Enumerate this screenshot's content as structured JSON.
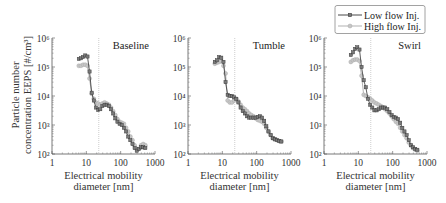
{
  "legend": {
    "items": [
      {
        "label": "Low flow Inj.",
        "color": "#333333",
        "marker": "square"
      },
      {
        "label": "High flow Inj.",
        "color": "#a8a8a8",
        "marker": "circle"
      }
    ]
  },
  "chart_data": [
    {
      "type": "line",
      "title": "Baseline",
      "xlabel": "Electrical mobility diameter [nm]",
      "xlabel_lines": [
        "Electrical mobility",
        "diameter [nm]"
      ],
      "ylabel": "Particle number concentration EEPS [#/cm³]",
      "ylabel_lines": [
        "Particle number",
        "concentration EEPS [#/cm³]"
      ],
      "xscale": "log",
      "yscale": "log",
      "xlim": [
        1,
        1000
      ],
      "ylim": [
        100,
        1000000
      ],
      "xticks": [
        1,
        10,
        100,
        1000
      ],
      "xticklabels": [
        "1",
        "10",
        "100",
        "1000"
      ],
      "yticks": [
        100,
        1000,
        10000,
        100000,
        1000000
      ],
      "yticklabels": [
        "10²",
        "10³",
        "10⁴",
        "10⁵",
        "10⁶"
      ],
      "vline_x": 23,
      "grid": false,
      "x": [
        6.04,
        6.98,
        8.06,
        9.31,
        10.8,
        12.4,
        14.3,
        16.5,
        19.1,
        22.1,
        25.5,
        29.4,
        34.0,
        39.2,
        45.3,
        52.3,
        60.4,
        69.8,
        80.6,
        93.1,
        107.5,
        124.1,
        143.3,
        165.5,
        191.1,
        220.7,
        254.8,
        294.3,
        339.8,
        392.4,
        453.2,
        523.3
      ],
      "series": [
        {
          "name": "Low flow Inj.",
          "values": [
            190000,
            200000,
            220000,
            250000,
            230000,
            70000,
            13000,
            7000,
            4000,
            3300,
            3500,
            4500,
            5000,
            5000,
            4500,
            3500,
            2500,
            1700,
            1300,
            1100,
            1000,
            800,
            600,
            400,
            300,
            220,
            160,
            130,
            150,
            170,
            170,
            160
          ]
        },
        {
          "name": "High flow Inj.",
          "values": [
            110000,
            110000,
            120000,
            120000,
            110000,
            40000,
            12000,
            8000,
            6000,
            5500,
            5000,
            5500,
            6000,
            5500,
            5000,
            4000,
            3000,
            2200,
            1600,
            1300,
            1200,
            1100,
            800,
            600,
            400,
            300,
            200,
            150,
            150,
            200,
            220,
            200
          ]
        }
      ]
    },
    {
      "type": "line",
      "title": "Tumble",
      "xlabel": "Electrical mobility diameter [nm]",
      "xlabel_lines": [
        "Electrical mobility",
        "diameter [nm]"
      ],
      "ylabel": "",
      "ylabel_lines": [],
      "xscale": "log",
      "yscale": "log",
      "xlim": [
        1,
        1000
      ],
      "ylim": [
        100,
        1000000
      ],
      "xticks": [
        1,
        10,
        100,
        1000
      ],
      "xticklabels": [
        "1",
        "10",
        "100",
        "1000"
      ],
      "yticks": [
        100,
        1000,
        10000,
        100000,
        1000000
      ],
      "yticklabels": [
        "10²",
        "10³",
        "10⁴",
        "10⁵",
        "10⁶"
      ],
      "vline_x": 23,
      "grid": false,
      "x": [
        6.04,
        6.98,
        8.06,
        9.31,
        10.8,
        12.4,
        14.3,
        16.5,
        19.1,
        22.1,
        25.5,
        29.4,
        34.0,
        39.2,
        45.3,
        52.3,
        60.4,
        69.8,
        80.6,
        93.1,
        107.5,
        124.1,
        143.3,
        165.5,
        191.1,
        220.7,
        254.8,
        294.3,
        339.8,
        392.4,
        453.2,
        523.3
      ],
      "series": [
        {
          "name": "Low flow Inj.",
          "values": [
            150000,
            170000,
            220000,
            210000,
            150000,
            30000,
            11000,
            10000,
            10000,
            9000,
            8000,
            6000,
            4000,
            3000,
            2500,
            2000,
            1800,
            1800,
            1800,
            1800,
            1900,
            2000,
            1800,
            1400,
            900,
            600,
            450,
            350,
            320,
            300,
            280,
            270
          ]
        },
        {
          "name": "High flow Inj.",
          "values": [
            130000,
            140000,
            150000,
            160000,
            110000,
            60000,
            7000,
            6000,
            6000,
            7000,
            8000,
            6500,
            5000,
            4000,
            3500,
            3000,
            2500,
            2200,
            2000,
            1700,
            1500,
            1400,
            1300,
            1100,
            800,
            600,
            450,
            350,
            320,
            300,
            280,
            270
          ]
        }
      ]
    },
    {
      "type": "line",
      "title": "Swirl",
      "xlabel": "Electrical mobility diameter [nm]",
      "xlabel_lines": [
        "Electrical mobility",
        "diameter [nm]"
      ],
      "ylabel": "",
      "ylabel_lines": [],
      "xscale": "log",
      "yscale": "log",
      "xlim": [
        1,
        1000
      ],
      "ylim": [
        100,
        1000000
      ],
      "xticks": [
        1,
        10,
        100,
        1000
      ],
      "xticklabels": [
        "1",
        "10",
        "100",
        "1000"
      ],
      "yticks": [
        100,
        1000,
        10000,
        100000,
        1000000
      ],
      "yticklabels": [
        "10²",
        "10³",
        "10⁴",
        "10⁵",
        "10⁶"
      ],
      "vline_x": 23,
      "grid": false,
      "legend_position": "top-right, above plot area",
      "x": [
        6.04,
        6.98,
        8.06,
        9.31,
        10.8,
        12.4,
        14.3,
        16.5,
        19.1,
        22.1,
        25.5,
        29.4,
        34.0,
        39.2,
        45.3,
        52.3,
        60.4,
        69.8,
        80.6,
        93.1,
        107.5,
        124.1,
        143.3,
        165.5,
        191.1,
        220.7,
        254.8,
        294.3,
        339.8,
        392.4,
        453.2,
        523.3
      ],
      "series": [
        {
          "name": "Low flow Inj.",
          "values": [
            260000,
            320000,
            420000,
            480000,
            400000,
            100000,
            35000,
            20000,
            8000,
            5000,
            4000,
            3200,
            3200,
            3500,
            4000,
            4000,
            4000,
            3500,
            2800,
            2200,
            1900,
            1800,
            1600,
            1200,
            800,
            600,
            450,
            300,
            200,
            170,
            150,
            140
          ]
        },
        {
          "name": "High flow Inj.",
          "values": [
            150000,
            170000,
            180000,
            180000,
            160000,
            50000,
            11000,
            10000,
            9000,
            8000,
            7000,
            6000,
            5500,
            5000,
            4500,
            4000,
            3500,
            3000,
            2500,
            2000,
            1600,
            1300,
            1100,
            800,
            600,
            450,
            350,
            250,
            200,
            160,
            140,
            130
          ]
        }
      ]
    }
  ]
}
